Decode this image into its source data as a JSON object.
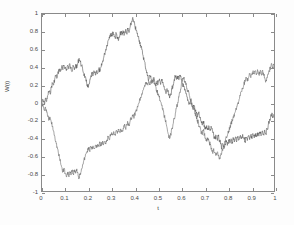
{
  "figure": {
    "background_color": "#fdfdfd",
    "axes_background_color": "#ffffff",
    "axes_border_color": "#8a8a8a"
  },
  "chart_data": {
    "type": "line",
    "title": "",
    "subtitle": "",
    "xlabel": "t",
    "ylabel": "W(t)",
    "xlim": [
      0,
      1
    ],
    "ylim": [
      -1,
      1
    ],
    "grid": false,
    "legend": null,
    "legend_position": "none",
    "xticks": [
      0,
      0.1,
      0.2,
      0.3,
      0.4,
      0.5,
      0.6,
      0.7,
      0.8,
      0.9,
      1
    ],
    "xtick_labels": [
      "0",
      "0.1",
      "0.2",
      "0.3",
      "0.4",
      "0.5",
      "0.6",
      "0.7",
      "0.8",
      "0.9",
      "1"
    ],
    "yticks": [
      -1,
      -0.8,
      -0.6,
      -0.4,
      -0.2,
      0,
      0.2,
      0.4,
      0.6,
      0.8,
      1
    ],
    "ytick_labels": [
      "-1",
      "-0.8",
      "-0.6",
      "-0.4",
      "-0.2",
      "0",
      "0.2",
      "0.4",
      "0.6",
      "0.8",
      "1"
    ],
    "annotations": [],
    "series": [
      {
        "name": "path-1",
        "color": "#555555",
        "line_width": 0.6,
        "x": [
          0,
          0.005,
          0.01,
          0.015,
          0.02,
          0.025,
          0.03,
          0.035,
          0.04,
          0.045,
          0.05,
          0.055,
          0.06,
          0.065,
          0.07,
          0.075,
          0.08,
          0.085,
          0.09,
          0.095,
          0.1,
          0.105,
          0.11,
          0.115,
          0.12,
          0.125,
          0.13,
          0.135,
          0.14,
          0.145,
          0.15,
          0.155,
          0.16,
          0.165,
          0.17,
          0.175,
          0.18,
          0.185,
          0.19,
          0.195,
          0.2,
          0.205,
          0.21,
          0.215,
          0.22,
          0.225,
          0.23,
          0.235,
          0.24,
          0.245,
          0.25,
          0.255,
          0.26,
          0.265,
          0.27,
          0.275,
          0.28,
          0.285,
          0.29,
          0.295,
          0.3,
          0.305,
          0.31,
          0.315,
          0.32,
          0.325,
          0.33,
          0.335,
          0.34,
          0.345,
          0.35,
          0.355,
          0.36,
          0.365,
          0.37,
          0.375,
          0.38,
          0.385,
          0.39,
          0.395,
          0.4,
          0.405,
          0.41,
          0.415,
          0.42,
          0.425,
          0.43,
          0.435,
          0.44,
          0.445,
          0.45,
          0.455,
          0.46,
          0.465,
          0.47,
          0.475,
          0.48,
          0.485,
          0.49,
          0.495,
          0.5,
          0.505,
          0.51,
          0.515,
          0.52,
          0.525,
          0.53,
          0.535,
          0.54,
          0.545,
          0.55,
          0.555,
          0.56,
          0.565,
          0.57,
          0.575,
          0.58,
          0.585,
          0.59,
          0.595,
          0.6,
          0.605,
          0.61,
          0.615,
          0.62,
          0.625,
          0.63,
          0.635,
          0.64,
          0.645,
          0.65,
          0.655,
          0.66,
          0.665,
          0.67,
          0.675,
          0.68,
          0.685,
          0.69,
          0.695,
          0.7,
          0.705,
          0.71,
          0.715,
          0.72,
          0.725,
          0.73,
          0.735,
          0.74,
          0.745,
          0.75,
          0.755,
          0.76,
          0.765,
          0.77,
          0.775,
          0.78,
          0.785,
          0.79,
          0.795,
          0.8,
          0.805,
          0.81,
          0.815,
          0.82,
          0.825,
          0.83,
          0.835,
          0.84,
          0.845,
          0.85,
          0.855,
          0.86,
          0.865,
          0.87,
          0.875,
          0.88,
          0.885,
          0.89,
          0.895,
          0.9,
          0.905,
          0.91,
          0.915,
          0.92,
          0.925,
          0.93,
          0.935,
          0.94,
          0.945,
          0.95,
          0.955,
          0.96,
          0.965,
          0.97,
          0.975,
          0.98,
          0.985,
          0.99,
          0.995,
          1
        ],
        "y": [
          0,
          0.03,
          -0.02,
          0.05,
          0.01,
          0.08,
          0.13,
          0.1,
          0.17,
          0.22,
          0.2,
          0.27,
          0.31,
          0.28,
          0.34,
          0.38,
          0.35,
          0.41,
          0.37,
          0.42,
          0.4,
          0.36,
          0.42,
          0.38,
          0.44,
          0.4,
          0.35,
          0.41,
          0.37,
          0.43,
          0.39,
          0.45,
          0.5,
          0.46,
          0.42,
          0.38,
          0.33,
          0.29,
          0.24,
          0.2,
          0.17,
          0.22,
          0.28,
          0.33,
          0.3,
          0.35,
          0.31,
          0.36,
          0.33,
          0.38,
          0.35,
          0.4,
          0.45,
          0.5,
          0.55,
          0.6,
          0.65,
          0.7,
          0.74,
          0.78,
          0.75,
          0.8,
          0.77,
          0.73,
          0.78,
          0.74,
          0.7,
          0.75,
          0.8,
          0.76,
          0.81,
          0.77,
          0.82,
          0.78,
          0.83,
          0.79,
          0.85,
          0.9,
          0.95,
          0.91,
          0.87,
          0.82,
          0.78,
          0.74,
          0.7,
          0.65,
          0.6,
          0.54,
          0.48,
          0.42,
          0.36,
          0.3,
          0.26,
          0.31,
          0.27,
          0.23,
          0.28,
          0.24,
          0.2,
          0.24,
          0.21,
          0.25,
          0.22,
          0.26,
          0.22,
          0.18,
          0.14,
          0.1,
          0.14,
          0.1,
          0.05,
          0.1,
          0.15,
          0.2,
          0.26,
          0.3,
          0.26,
          0.3,
          0.26,
          0.3,
          0.26,
          0.22,
          0.18,
          0.14,
          0.1,
          0.06,
          0.02,
          -0.02,
          0.02,
          -0.03,
          -0.07,
          -0.03,
          -0.08,
          -0.12,
          -0.16,
          -0.12,
          -0.17,
          -0.21,
          -0.25,
          -0.21,
          -0.26,
          -0.3,
          -0.26,
          -0.31,
          -0.27,
          -0.32,
          -0.28,
          -0.33,
          -0.37,
          -0.41,
          -0.37,
          -0.42,
          -0.38,
          -0.43,
          -0.47,
          -0.51,
          -0.47,
          -0.52,
          -0.48,
          -0.43,
          -0.47,
          -0.42,
          -0.46,
          -0.41,
          -0.45,
          -0.4,
          -0.44,
          -0.39,
          -0.43,
          -0.38,
          -0.42,
          -0.37,
          -0.41,
          -0.36,
          -0.4,
          -0.44,
          -0.39,
          -0.43,
          -0.38,
          -0.42,
          -0.37,
          -0.41,
          -0.36,
          -0.4,
          -0.35,
          -0.39,
          -0.34,
          -0.38,
          -0.33,
          -0.37,
          -0.32,
          -0.36,
          -0.31,
          -0.35,
          -0.3,
          -0.26,
          -0.21,
          -0.17,
          -0.13,
          -0.16,
          -0.13
        ]
      },
      {
        "name": "path-2",
        "color": "#6b6b6b",
        "line_width": 0.6,
        "x": [
          0,
          0.005,
          0.01,
          0.015,
          0.02,
          0.025,
          0.03,
          0.035,
          0.04,
          0.045,
          0.05,
          0.055,
          0.06,
          0.065,
          0.07,
          0.075,
          0.08,
          0.085,
          0.09,
          0.095,
          0.1,
          0.105,
          0.11,
          0.115,
          0.12,
          0.125,
          0.13,
          0.135,
          0.14,
          0.145,
          0.15,
          0.155,
          0.16,
          0.165,
          0.17,
          0.175,
          0.18,
          0.185,
          0.19,
          0.195,
          0.2,
          0.205,
          0.21,
          0.215,
          0.22,
          0.225,
          0.23,
          0.235,
          0.24,
          0.245,
          0.25,
          0.255,
          0.26,
          0.265,
          0.27,
          0.275,
          0.28,
          0.285,
          0.29,
          0.295,
          0.3,
          0.305,
          0.31,
          0.315,
          0.32,
          0.325,
          0.33,
          0.335,
          0.34,
          0.345,
          0.35,
          0.355,
          0.36,
          0.365,
          0.37,
          0.375,
          0.38,
          0.385,
          0.39,
          0.395,
          0.4,
          0.405,
          0.41,
          0.415,
          0.42,
          0.425,
          0.43,
          0.435,
          0.44,
          0.445,
          0.45,
          0.455,
          0.46,
          0.465,
          0.47,
          0.475,
          0.48,
          0.485,
          0.49,
          0.495,
          0.5,
          0.505,
          0.51,
          0.515,
          0.52,
          0.525,
          0.53,
          0.535,
          0.54,
          0.545,
          0.55,
          0.555,
          0.56,
          0.565,
          0.57,
          0.575,
          0.58,
          0.585,
          0.59,
          0.595,
          0.6,
          0.605,
          0.61,
          0.615,
          0.62,
          0.625,
          0.63,
          0.635,
          0.64,
          0.645,
          0.65,
          0.655,
          0.66,
          0.665,
          0.67,
          0.675,
          0.68,
          0.685,
          0.69,
          0.695,
          0.7,
          0.705,
          0.71,
          0.715,
          0.72,
          0.725,
          0.73,
          0.735,
          0.74,
          0.745,
          0.75,
          0.755,
          0.76,
          0.765,
          0.77,
          0.775,
          0.78,
          0.785,
          0.79,
          0.795,
          0.8,
          0.805,
          0.81,
          0.815,
          0.82,
          0.825,
          0.83,
          0.835,
          0.84,
          0.845,
          0.85,
          0.855,
          0.86,
          0.865,
          0.87,
          0.875,
          0.88,
          0.885,
          0.89,
          0.895,
          0.9,
          0.905,
          0.91,
          0.915,
          0.92,
          0.925,
          0.93,
          0.935,
          0.94,
          0.945,
          0.95,
          0.955,
          0.96,
          0.965,
          0.97,
          0.975,
          0.98,
          0.985,
          0.99,
          0.995,
          1
        ],
        "y": [
          0,
          -0.04,
          -0.09,
          -0.05,
          -0.11,
          -0.16,
          -0.2,
          -0.17,
          -0.22,
          -0.27,
          -0.32,
          -0.38,
          -0.44,
          -0.5,
          -0.56,
          -0.62,
          -0.68,
          -0.73,
          -0.78,
          -0.74,
          -0.8,
          -0.84,
          -0.79,
          -0.83,
          -0.78,
          -0.82,
          -0.77,
          -0.81,
          -0.76,
          -0.8,
          -0.75,
          -0.8,
          -0.85,
          -0.8,
          -0.75,
          -0.7,
          -0.66,
          -0.62,
          -0.58,
          -0.55,
          -0.51,
          -0.54,
          -0.5,
          -0.53,
          -0.49,
          -0.52,
          -0.48,
          -0.51,
          -0.47,
          -0.5,
          -0.46,
          -0.49,
          -0.45,
          -0.48,
          -0.44,
          -0.47,
          -0.43,
          -0.39,
          -0.42,
          -0.38,
          -0.34,
          -0.37,
          -0.33,
          -0.36,
          -0.32,
          -0.35,
          -0.31,
          -0.34,
          -0.3,
          -0.33,
          -0.29,
          -0.26,
          -0.29,
          -0.25,
          -0.22,
          -0.25,
          -0.21,
          -0.18,
          -0.14,
          -0.17,
          -0.13,
          -0.1,
          -0.06,
          -0.02,
          0.02,
          0.06,
          0.1,
          0.14,
          0.17,
          0.2,
          0.23,
          0.2,
          0.24,
          0.21,
          0.25,
          0.22,
          0.26,
          0.22,
          0.18,
          0.14,
          0.1,
          0.06,
          0.02,
          -0.03,
          -0.08,
          -0.13,
          -0.18,
          -0.24,
          -0.3,
          -0.36,
          -0.41,
          -0.36,
          -0.3,
          -0.24,
          -0.18,
          -0.12,
          -0.06,
          0.0,
          0.06,
          0.12,
          0.18,
          0.24,
          0.28,
          0.24,
          0.2,
          0.16,
          0.12,
          0.08,
          0.04,
          0.0,
          -0.04,
          -0.08,
          -0.12,
          -0.16,
          -0.2,
          -0.24,
          -0.28,
          -0.32,
          -0.36,
          -0.32,
          -0.36,
          -0.4,
          -0.44,
          -0.4,
          -0.44,
          -0.48,
          -0.52,
          -0.56,
          -0.52,
          -0.56,
          -0.6,
          -0.56,
          -0.6,
          -0.64,
          -0.6,
          -0.56,
          -0.52,
          -0.48,
          -0.44,
          -0.4,
          -0.36,
          -0.32,
          -0.28,
          -0.24,
          -0.2,
          -0.16,
          -0.12,
          -0.08,
          -0.04,
          0.0,
          0.04,
          0.08,
          0.12,
          0.16,
          0.2,
          0.24,
          0.28,
          0.24,
          0.28,
          0.32,
          0.28,
          0.32,
          0.36,
          0.32,
          0.36,
          0.32,
          0.36,
          0.32,
          0.36,
          0.32,
          0.36,
          0.32,
          0.28,
          0.24,
          0.28,
          0.32,
          0.36,
          0.4,
          0.44,
          0.4,
          0.43
        ]
      }
    ]
  }
}
